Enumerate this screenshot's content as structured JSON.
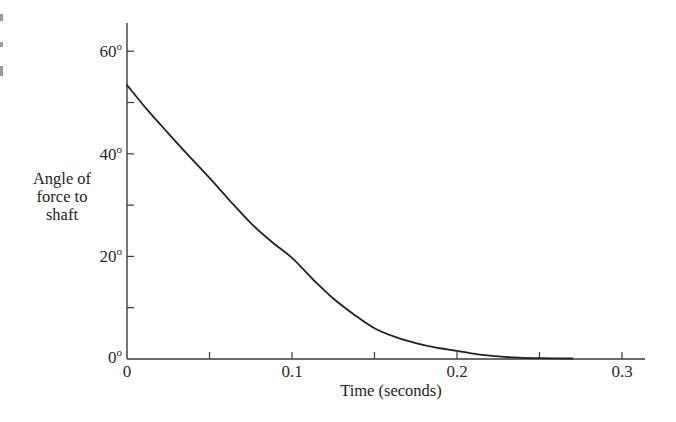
{
  "chart_data": {
    "type": "line",
    "title": "",
    "xlabel": "Time (seconds)",
    "ylabel": "Angle of force to shaft",
    "ylabel_lines": [
      "Angle of",
      "force to",
      "shaft"
    ],
    "xlim": [
      0,
      0.3
    ],
    "ylim": [
      0,
      65
    ],
    "grid": false,
    "legend": null,
    "x_ticks": [
      0,
      0.05,
      0.1,
      0.15,
      0.2,
      0.25,
      0.3
    ],
    "x_tick_labels": [
      "0",
      "",
      "0.1",
      "",
      "0.2",
      "",
      "0.3"
    ],
    "y_ticks": [
      0,
      10,
      20,
      30,
      40,
      50,
      60
    ],
    "y_tick_labels": [
      "0",
      "",
      "20",
      "",
      "40",
      "",
      "60"
    ],
    "y_tick_unit": "o",
    "series": [
      {
        "name": "Angle of force to shaft",
        "x": [
          0,
          0.0125,
          0.025,
          0.0375,
          0.05,
          0.0625,
          0.075,
          0.0875,
          0.1,
          0.1125,
          0.125,
          0.1375,
          0.15,
          0.1625,
          0.175,
          0.1875,
          0.2,
          0.2125,
          0.225,
          0.2375,
          0.25,
          0.27
        ],
        "values": [
          53.4,
          48.5,
          44.0,
          39.6,
          35.3,
          30.8,
          26.5,
          22.9,
          19.7,
          15.6,
          11.8,
          8.7,
          6.0,
          4.3,
          3.1,
          2.2,
          1.6,
          0.9,
          0.5,
          0.25,
          0.15,
          0.1
        ]
      }
    ]
  }
}
